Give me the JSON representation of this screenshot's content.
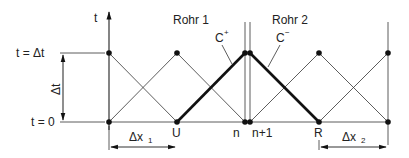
{
  "diagram": {
    "axis": {
      "t_label": "t"
    },
    "levels": {
      "top": "t = Δt",
      "bottom": "t = 0",
      "span": "Δt"
    },
    "pipes": {
      "left": "Rohr 1",
      "right": "Rohr 2"
    },
    "characteristics": {
      "plus": "C",
      "plus_sup": "+",
      "minus": "C",
      "minus_sup": "−"
    },
    "nodes": {
      "U": "U",
      "n": "n",
      "n1": "n+1",
      "R": "R"
    },
    "spacings": {
      "dx1": "Δx",
      "dx1_sub": "1",
      "dx2": "Δx",
      "dx2_sub": "2"
    }
  }
}
